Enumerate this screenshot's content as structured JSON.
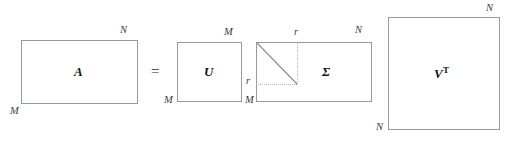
{
  "diagram": {
    "equation_symbol": "=",
    "matrices": [
      {
        "id": "A",
        "label": "A",
        "shape": "rectangle",
        "top_right_dim": "N",
        "bottom_left_dim": "M"
      },
      {
        "id": "U",
        "label": "U",
        "shape": "square",
        "top_right_dim": "M",
        "bottom_left_dim": "M"
      },
      {
        "id": "Sigma",
        "label": "Σ",
        "shape": "rectangle",
        "top_right_dim": "N",
        "bottom_left_dim": "M",
        "rank_top_dim": "r",
        "rank_left_dim": "r"
      },
      {
        "id": "VT",
        "label": "V",
        "label_superscript": "T",
        "shape": "square",
        "top_right_dim": "N",
        "bottom_left_dim": "N"
      }
    ],
    "colors": {
      "border": "#9a9a9a",
      "guide": "#b4b4b4",
      "diagonal": "#8c8c8c",
      "text": "#121212",
      "background": "#ffffff"
    }
  }
}
